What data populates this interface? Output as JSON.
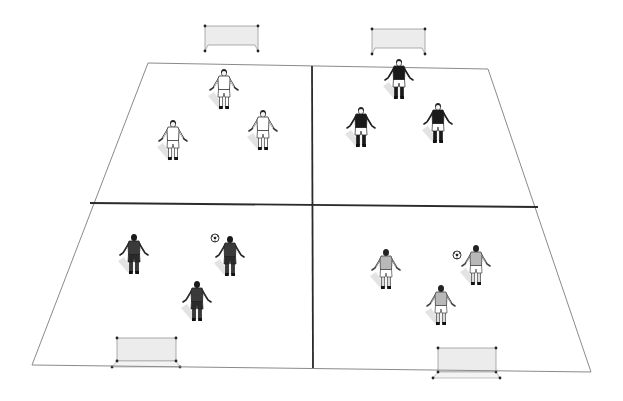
{
  "diagram": {
    "type": "soccer-training-drill",
    "colors": {
      "background": "#ffffff",
      "field_line": "#8a8a8a",
      "divider_line": "#2b2b2b",
      "goal_net": "#ececec",
      "goal_frame": "#9a9a9a",
      "team_white": "#ffffff",
      "team_black": "#1a1a1a",
      "team_dark": "#3a3a3a",
      "team_grey": "#b8b8b8"
    },
    "field": {
      "corners": {
        "top_left": [
          148,
          63
        ],
        "top_right": [
          488,
          69
        ],
        "bottom_right": [
          591,
          372
        ],
        "bottom_left": [
          32,
          365
        ]
      },
      "horizontal_divider": {
        "from": [
          90,
          203
        ],
        "to": [
          538,
          207
        ]
      },
      "vertical_divider": {
        "from": [
          312,
          66
        ],
        "to": [
          313,
          368
        ]
      }
    },
    "goals": [
      {
        "name": "goal-top-left",
        "position": "top",
        "x": 205,
        "y": 26,
        "w": 53,
        "h": 25
      },
      {
        "name": "goal-top-right",
        "position": "top",
        "x": 372,
        "y": 29,
        "w": 53,
        "h": 25
      },
      {
        "name": "goal-bottom-left",
        "position": "bottom",
        "x": 117,
        "y": 338,
        "w": 59,
        "h": 29
      },
      {
        "name": "goal-bottom-right",
        "position": "bottom",
        "x": 438,
        "y": 348,
        "w": 58,
        "h": 30
      }
    ],
    "quadrants": [
      {
        "name": "top-left",
        "team": "white",
        "facing": "front",
        "players": [
          {
            "x": 224,
            "y": 70
          },
          {
            "x": 173,
            "y": 121
          },
          {
            "x": 263,
            "y": 111
          }
        ],
        "ball": null
      },
      {
        "name": "top-right",
        "team": "black",
        "facing": "front",
        "players": [
          {
            "x": 399,
            "y": 60
          },
          {
            "x": 361,
            "y": 108
          },
          {
            "x": 438,
            "y": 104
          }
        ],
        "ball": null
      },
      {
        "name": "bottom-left",
        "team": "dark",
        "facing": "back",
        "players": [
          {
            "x": 134,
            "y": 235
          },
          {
            "x": 230,
            "y": 237
          },
          {
            "x": 197,
            "y": 282
          }
        ],
        "ball": {
          "x": 215,
          "y": 238
        }
      },
      {
        "name": "bottom-right",
        "team": "grey",
        "facing": "back",
        "players": [
          {
            "x": 386,
            "y": 250
          },
          {
            "x": 476,
            "y": 246
          },
          {
            "x": 441,
            "y": 286
          }
        ],
        "ball": {
          "x": 457,
          "y": 255
        }
      }
    ]
  }
}
